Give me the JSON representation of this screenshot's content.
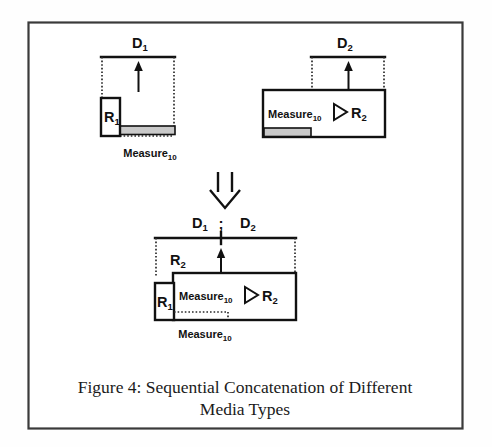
{
  "figure": {
    "caption_line1": "Figure 4: Sequential Concatenation of Different",
    "caption_line2": "Media Types",
    "frame_color": "#3a3a3a",
    "ink_color": "#111111",
    "shade_color": "#c9c9c9",
    "background": "#ffffff"
  },
  "panels": {
    "top_left": {
      "name": "D1 media object",
      "top_label": "D",
      "top_label_sub": "1",
      "inner_box_label": "R",
      "inner_box_label_sub": "1",
      "bottom_label": "Measure",
      "bottom_label_sub": "10",
      "arrow": "up-arrow"
    },
    "top_right": {
      "name": "D2 media object",
      "top_label": "D",
      "top_label_sub": "2",
      "expr_left": "Measure",
      "expr_left_sub": "10",
      "expr_operator": "triangle-right",
      "expr_right": "R",
      "expr_right_sub": "2",
      "arrow": "up-arrow"
    },
    "result": {
      "name": "D1 ; D2 concatenation result",
      "top_label_a": "D",
      "top_label_a_sub": "1",
      "separator": ";",
      "top_label_b": "D",
      "top_label_b_sub": "2",
      "region_label": "R",
      "region_label_sub": "2",
      "inner_box_label": "R",
      "inner_box_label_sub": "1",
      "expr_left": "Measure",
      "expr_left_sub": "10",
      "expr_operator": "triangle-right",
      "expr_right": "R",
      "expr_right_sub": "2",
      "bottom_label": "Measure",
      "bottom_label_sub": "10",
      "arrow": "up-arrow"
    },
    "transform": {
      "name": "sequential concatenation operator",
      "glyph": "double-down-arrow"
    }
  }
}
